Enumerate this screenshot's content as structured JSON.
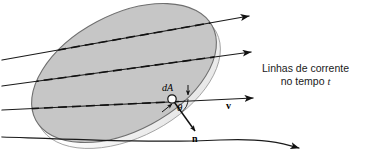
{
  "figure": {
    "width": 365,
    "height": 151,
    "background": "#ffffff"
  },
  "caption": {
    "line1": "Linhas de corrente",
    "line2_prefix": "no tempo ",
    "line2_symbol": "t",
    "x": 253,
    "y": 62
  },
  "labels": {
    "area_element": "dA",
    "angle": "θ",
    "normal": "n",
    "velocity": "v"
  },
  "colors": {
    "surface_fill": "#c6c6c6",
    "surface_edge": "#7a7a7a",
    "surface_rim": "#fdfdfd",
    "streamline": "#1a1a1a",
    "dashed_streamline": "#111111",
    "text": "#1a1a1a",
    "dA_marker_fill": "#ffffff"
  },
  "surface": {
    "shape": "ellipse",
    "center_x": 124,
    "center_y": 73,
    "radius_x": 100,
    "radius_y": 58,
    "rotation_deg": -28
  },
  "streamlines": [
    {
      "id": "streamline-1",
      "label": "top",
      "start_x": 2,
      "start_y": 60,
      "end_x": 249,
      "end_y": 16,
      "arrow": true,
      "dashed_segment": true
    },
    {
      "id": "streamline-2",
      "label": "upper-middle",
      "start_x": 2,
      "start_y": 86,
      "end_x": 251,
      "end_y": 52,
      "arrow": true,
      "dashed_segment": true
    },
    {
      "id": "streamline-3",
      "label": "through-dA",
      "start_x": 2,
      "start_y": 110,
      "end_x": 253,
      "end_y": 98,
      "arrow": true,
      "dashed_segment": true
    },
    {
      "id": "streamline-4",
      "label": "bottom",
      "start_x": 2,
      "start_y": 137,
      "end_x": 300,
      "end_y": 148,
      "arrow": true,
      "dashed_segment": false
    }
  ],
  "vectors": [
    {
      "id": "normal-vector",
      "symbol": "n",
      "from_x": 172,
      "from_y": 99,
      "to_x": 196,
      "to_y": 133,
      "bold": true
    },
    {
      "id": "velocity-vector",
      "symbol": "v",
      "along": "streamline-3",
      "tip_x": 253,
      "tip_y": 98,
      "bold": true
    },
    {
      "id": "dA-tick",
      "symbol": "",
      "from_x": 188,
      "from_y": 86,
      "to_x": 188,
      "to_y": 96,
      "bold": false
    }
  ],
  "angle_arc": {
    "id": "theta-arc",
    "center_x": 172,
    "center_y": 99,
    "radius": 16,
    "symbol": "θ"
  }
}
